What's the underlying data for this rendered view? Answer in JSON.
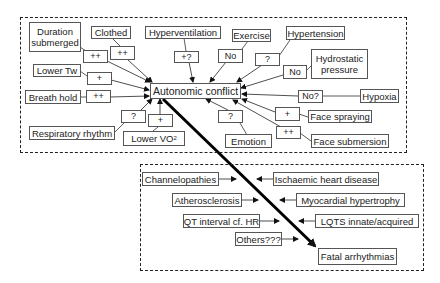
{
  "diagram": {
    "central_node": "Autonomic conflict",
    "outcome_node": "Fatal arrhythmias",
    "factors": [
      {
        "id": "duration",
        "label": "Duration submerged",
        "effect": "++"
      },
      {
        "id": "clothed",
        "label": "Clothed",
        "effect": "++"
      },
      {
        "id": "hypervent",
        "label": "Hyperventilation",
        "effect": "+?"
      },
      {
        "id": "exercise",
        "label": "Exercise",
        "effect": "No"
      },
      {
        "id": "hypertension",
        "label": "Hypertension",
        "effect": "?"
      },
      {
        "id": "hydrostatic",
        "label": "Hydrostatic pressure",
        "effect": "No"
      },
      {
        "id": "lowertw",
        "label": "Lower Tw",
        "effect": "+"
      },
      {
        "id": "breathhold",
        "label": "Breath hold",
        "effect": "++"
      },
      {
        "id": "hypoxia",
        "label": "Hypoxia",
        "effect": "No?"
      },
      {
        "id": "facespray",
        "label": "Face spraying",
        "effect": "+"
      },
      {
        "id": "resp",
        "label": "Respiratory rhythm",
        "effect": "?"
      },
      {
        "id": "lowervo2",
        "label": "Lower VO",
        "label_sub": "2",
        "effect": "+"
      },
      {
        "id": "emotion",
        "label": "Emotion",
        "effect": "?"
      },
      {
        "id": "facesub",
        "label": "Face submersion",
        "effect": "++"
      }
    ],
    "contributors": [
      {
        "id": "channel",
        "label": "Channelopathies"
      },
      {
        "id": "ischaemic",
        "label": "Ischaemic heart disease"
      },
      {
        "id": "athero",
        "label": "Atherosclerosis"
      },
      {
        "id": "myocardial",
        "label": "Myocardial hypertrophy"
      },
      {
        "id": "qt",
        "label": "QT interval cf. HR"
      },
      {
        "id": "lqts",
        "label": "LQTS innate/acquired"
      },
      {
        "id": "others",
        "label": "Others???"
      }
    ]
  }
}
